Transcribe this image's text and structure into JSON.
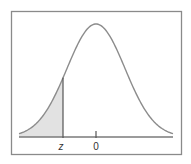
{
  "figure": {
    "type": "normal-distribution-diagram",
    "labels": {
      "z": "z",
      "zero": "0"
    },
    "colors": {
      "curve": "#8c8c8c",
      "shade": "#e2e2e2",
      "frame": "#8a8a8a",
      "axis": "#7a7a7a",
      "marker": "#555555"
    },
    "shaded_region": "left tail, from -infinity to z",
    "z_value_approx": -1.1,
    "mean": 0
  }
}
